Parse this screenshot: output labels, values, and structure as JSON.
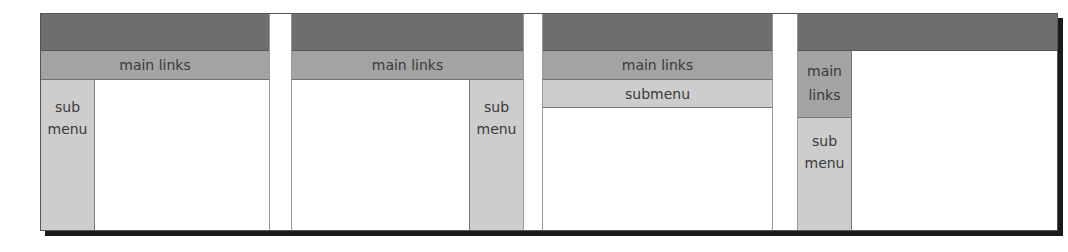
{
  "diagram": {
    "type": "layout-wireframe-variants",
    "colors": {
      "header": "#6e6e6e",
      "main_links": "#a3a3a3",
      "submenu": "#cdcdcd",
      "content": "#ffffff",
      "shadow": "#1a1a1a"
    },
    "panels": [
      {
        "id": 1,
        "main_links": "main links",
        "submenu_position": "left",
        "submenu_lines": [
          "sub",
          "menu"
        ]
      },
      {
        "id": 2,
        "main_links": "main links",
        "submenu_position": "right",
        "submenu_lines": [
          "sub",
          "menu"
        ]
      },
      {
        "id": 3,
        "main_links": "main links",
        "submenu_position": "top",
        "submenu_label": "submenu"
      },
      {
        "id": 4,
        "main_links_position": "left",
        "main_links_lines": [
          "main",
          "links"
        ],
        "submenu_position": "left",
        "submenu_lines": [
          "sub",
          "menu"
        ]
      }
    ]
  }
}
